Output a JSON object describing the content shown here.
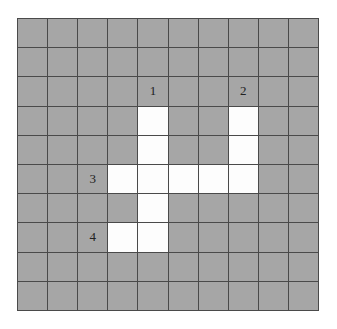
{
  "grid": {
    "rows": 10,
    "cols": 10,
    "colors": {
      "filled": "#a6a6a6",
      "empty": "#fdfdfd",
      "line": "#4a4a4a"
    },
    "white_cells": [
      [
        3,
        4
      ],
      [
        3,
        7
      ],
      [
        4,
        4
      ],
      [
        4,
        7
      ],
      [
        5,
        3
      ],
      [
        5,
        4
      ],
      [
        5,
        5
      ],
      [
        5,
        6
      ],
      [
        5,
        7
      ],
      [
        6,
        4
      ],
      [
        7,
        3
      ],
      [
        7,
        4
      ]
    ],
    "labels": [
      {
        "row": 2,
        "col": 4,
        "text": "1"
      },
      {
        "row": 2,
        "col": 7,
        "text": "2"
      },
      {
        "row": 5,
        "col": 2,
        "text": "3"
      },
      {
        "row": 7,
        "col": 2,
        "text": "4"
      }
    ]
  }
}
